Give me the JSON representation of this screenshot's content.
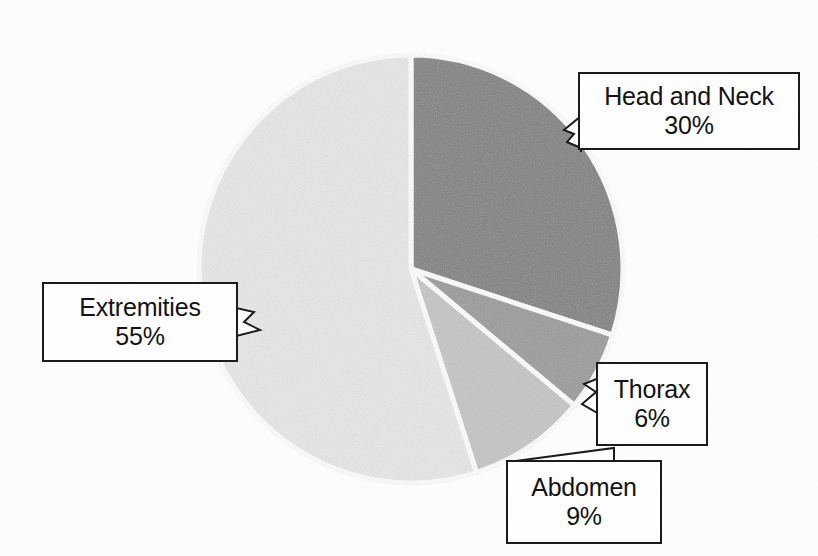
{
  "chart_data": {
    "type": "pie",
    "title": "",
    "categories": [
      "Head and Neck",
      "Thorax",
      "Abdomen",
      "Extremities"
    ],
    "values": [
      30,
      6,
      9,
      55
    ],
    "value_labels": [
      "30%",
      "6%",
      "9%",
      "55%"
    ],
    "units": "percent",
    "total": 100,
    "start_angle_deg": 0,
    "direction": "clockwise",
    "legend": "callout-labels",
    "grid": false,
    "slices": [
      {
        "label": "Head and Neck",
        "value": 30,
        "value_label": "30%",
        "color": "#808080",
        "start_deg": 0,
        "end_deg": 108
      },
      {
        "label": "Thorax",
        "value": 6,
        "value_label": "6%",
        "color": "#9a9a9a",
        "start_deg": 108,
        "end_deg": 129.6
      },
      {
        "label": "Abdomen",
        "value": 9,
        "value_label": "9%",
        "color": "#c6c6c6",
        "start_deg": 129.6,
        "end_deg": 162
      },
      {
        "label": "Extremities",
        "value": 55,
        "value_label": "55%",
        "color": "#e9e9e9",
        "start_deg": 162,
        "end_deg": 360
      }
    ]
  },
  "callouts": {
    "head_and_neck": {
      "name": "Head and Neck",
      "value": "30%"
    },
    "extremities": {
      "name": "Extremities",
      "value": "55%"
    },
    "thorax": {
      "name": "Thorax",
      "value": "6%"
    },
    "abdomen": {
      "name": "Abdomen",
      "value": "9%"
    }
  },
  "colors": {
    "page_background": "#fdfdfd",
    "outline": "#1a1a1a",
    "slice_separator": "#ffffff",
    "text": "#111111"
  }
}
